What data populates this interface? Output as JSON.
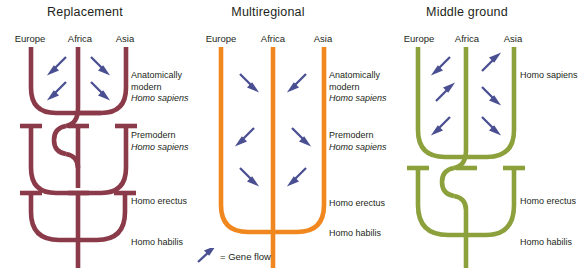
{
  "figure": {
    "legend": {
      "symbol_name": "gene-flow-arrow",
      "text": "= Gene flow"
    },
    "arrow_color": "#4a4f91"
  },
  "panels": [
    {
      "id": "replacement",
      "title": "Replacement",
      "color": "#8b3a4a",
      "regions": [
        "Europe",
        "Africa",
        "Asia"
      ],
      "stages": [
        {
          "line1": "Anatomically",
          "line2": "modern",
          "line3": "Homo sapiens"
        },
        {
          "line1": "Premodern",
          "line2": "Homo sapiens"
        },
        {
          "line1": "Homo erectus"
        },
        {
          "line1": "Homo habilis"
        }
      ]
    },
    {
      "id": "multiregional",
      "title": "Multiregional",
      "color": "#f0871f",
      "regions": [
        "Europe",
        "Africa",
        "Asia"
      ],
      "stages": [
        {
          "line1": "Anatomically",
          "line2": "modern",
          "line3": "Homo sapiens"
        },
        {
          "line1": "Premodern",
          "line2": "Homo sapiens"
        },
        {
          "line1": "Homo erectus"
        },
        {
          "line1": "Homo habilis"
        }
      ]
    },
    {
      "id": "middleground",
      "title": "Middle ground",
      "color": "#8ca03c",
      "regions": [
        "Europe",
        "Africa",
        "Asia"
      ],
      "stages": [
        {
          "line1": "Homo  sapiens"
        },
        {
          "line1": "Homo erectus"
        },
        {
          "line1": "Homo habilis"
        }
      ]
    }
  ]
}
